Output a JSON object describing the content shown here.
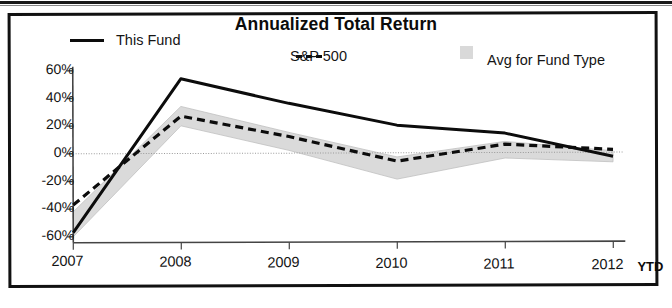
{
  "chart_data": {
    "type": "line",
    "title": "Annualized Total Return",
    "xlabel": "",
    "ylabel": "",
    "x": [
      "2007",
      "2008",
      "2009",
      "2010",
      "2011",
      "2012"
    ],
    "x_suffix_label": "YTD",
    "ylim": [
      -60,
      60
    ],
    "ytick_values": [
      60,
      40,
      20,
      0,
      -20,
      -40,
      -60
    ],
    "ytick_labels": [
      "60%",
      "40%",
      "20%",
      "0%",
      "-20%",
      "-40%",
      "-60%"
    ],
    "grid": false,
    "zero_line": true,
    "legend_position": "top",
    "series": [
      {
        "name": "This Fund",
        "style": "solid",
        "color": "#0c0c0c",
        "values": [
          -57,
          54,
          36,
          20,
          14,
          -3
        ]
      },
      {
        "name": "S&P 500",
        "style": "dashed",
        "color": "#0c0c0c",
        "values": [
          -37,
          27,
          12,
          -6,
          6,
          2
        ]
      },
      {
        "name": "Avg for Fund Type",
        "style": "band",
        "color": "#d9d9d9",
        "band_upper": [
          -42,
          34,
          15,
          -3,
          8,
          1
        ],
        "band_lower": [
          -60,
          20,
          2,
          -19,
          -4,
          -7
        ]
      }
    ]
  },
  "legend": {
    "items": [
      {
        "label": "This Fund",
        "swatch": "solid-line-swatch"
      },
      {
        "label": "S&P 500",
        "swatch": "dashed-line-swatch"
      },
      {
        "label": "Avg for Fund Type",
        "swatch": "gray-band-swatch"
      }
    ]
  },
  "axes": {
    "y_labels": [
      "60%",
      "40%",
      "20%",
      "0%",
      "-20%",
      "-40%",
      "-60%"
    ],
    "x_labels": [
      "2007",
      "2008",
      "2009",
      "2010",
      "2011",
      "2012"
    ],
    "ytd_label": "YTD"
  },
  "colors": {
    "line": "#0c0c0c",
    "band": "#d9d9d9",
    "axis": "#444444",
    "frame": "#111111",
    "text": "#141414"
  }
}
